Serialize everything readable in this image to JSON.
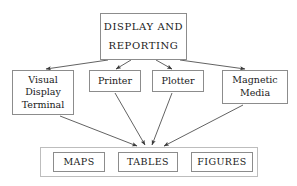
{
  "diagram": {
    "style": {
      "background": "#ffffff",
      "box_border": "#8c8c8c",
      "group_border": "#bdbdbd",
      "text": "#1a1a1a",
      "edge": "#3a3a3a"
    },
    "root": {
      "id": "display-and-reporting",
      "lines": [
        "DISPLAY  AND",
        "REPORTING"
      ]
    },
    "devices": [
      {
        "id": "visual-display-terminal",
        "lines": [
          "Visual",
          "Display",
          "Terminal"
        ]
      },
      {
        "id": "printer",
        "lines": [
          "Printer"
        ]
      },
      {
        "id": "plotter",
        "lines": [
          "Plotter"
        ]
      },
      {
        "id": "magnetic-media",
        "lines": [
          "Magnetic",
          "Media"
        ]
      }
    ],
    "outputs": [
      {
        "id": "maps",
        "label": "MAPS"
      },
      {
        "id": "tables",
        "label": "TABLES"
      },
      {
        "id": "figures",
        "label": "FIGURES"
      }
    ],
    "edges": [
      {
        "from": "display-and-reporting",
        "to": "visual-display-terminal"
      },
      {
        "from": "display-and-reporting",
        "to": "printer"
      },
      {
        "from": "display-and-reporting",
        "to": "plotter"
      },
      {
        "from": "display-and-reporting",
        "to": "magnetic-media"
      },
      {
        "from": "visual-display-terminal",
        "to": "outputs-group"
      },
      {
        "from": "printer",
        "to": "outputs-group"
      },
      {
        "from": "plotter",
        "to": "outputs-group"
      },
      {
        "from": "magnetic-media",
        "to": "outputs-group"
      }
    ]
  }
}
